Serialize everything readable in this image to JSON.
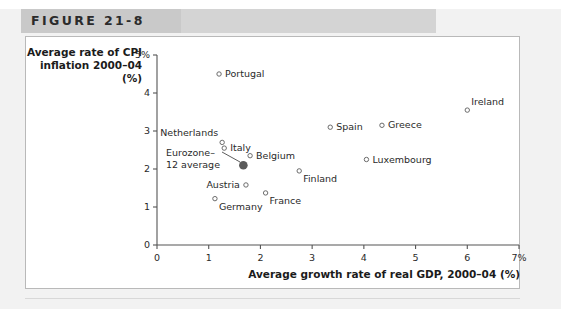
{
  "figure": {
    "label": "FIGURE 21-8"
  },
  "chart_data": {
    "type": "scatter",
    "title": "",
    "xlabel": "Average growth rate of real GDP, 2000–04 (%)",
    "ylabel_lines": [
      "Average rate of CPI",
      "inflation 2000–04",
      "(%)"
    ],
    "xlim": [
      0,
      7
    ],
    "ylim": [
      0,
      5
    ],
    "xticks": [
      0,
      1,
      2,
      3,
      4,
      5,
      6,
      7
    ],
    "xticklabels": [
      "0",
      "1",
      "2",
      "3",
      "4",
      "5",
      "6",
      "7%"
    ],
    "yticks": [
      0,
      1,
      2,
      3,
      4,
      5
    ],
    "yticklabels": [
      "0",
      "1",
      "2",
      "3",
      "4",
      "5%"
    ],
    "grid": false,
    "legend": false,
    "points": [
      {
        "name": "Portugal",
        "x": 1.2,
        "y": 4.5,
        "marker": "open",
        "label_pos": "right"
      },
      {
        "name": "Ireland",
        "x": 6.0,
        "y": 3.55,
        "marker": "open",
        "label_pos": "above-right"
      },
      {
        "name": "Greece",
        "x": 4.35,
        "y": 3.15,
        "marker": "open",
        "label_pos": "right"
      },
      {
        "name": "Spain",
        "x": 3.35,
        "y": 3.1,
        "marker": "open",
        "label_pos": "right"
      },
      {
        "name": "Netherlands",
        "x": 1.26,
        "y": 2.7,
        "marker": "open",
        "label_pos": "above-left"
      },
      {
        "name": "Italy",
        "x": 1.3,
        "y": 2.55,
        "marker": "open",
        "label_pos": "right"
      },
      {
        "name": "Belgium",
        "x": 1.8,
        "y": 2.35,
        "marker": "open",
        "label_pos": "right"
      },
      {
        "name": "Luxembourg",
        "x": 4.05,
        "y": 2.25,
        "marker": "open",
        "label_pos": "right"
      },
      {
        "name": "Eurozone-12 average",
        "x": 1.67,
        "y": 2.1,
        "marker": "filled",
        "label_pos": "callout"
      },
      {
        "name": "Finland",
        "x": 2.75,
        "y": 1.95,
        "marker": "open",
        "label_pos": "below-right"
      },
      {
        "name": "Austria",
        "x": 1.72,
        "y": 1.58,
        "marker": "open",
        "label_pos": "left"
      },
      {
        "name": "France",
        "x": 2.1,
        "y": 1.37,
        "marker": "open",
        "label_pos": "below-right"
      },
      {
        "name": "Germany",
        "x": 1.12,
        "y": 1.22,
        "marker": "open",
        "label_pos": "below-right"
      }
    ],
    "callout": {
      "line1": "Eurozone–",
      "line2": "12 average"
    },
    "colors": {
      "axis": "#555555",
      "marker_open_stroke": "#6b6b6b",
      "marker_filled": "#5a5a5a",
      "text": "#2a2a2a",
      "header_band": "#d4d4d4",
      "panel_bg": "#ffffff",
      "page_bg": "#f2f2f2"
    }
  }
}
